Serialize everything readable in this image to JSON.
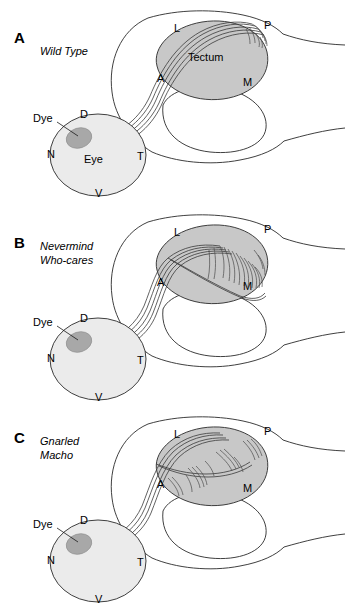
{
  "figure": {
    "background_color": "#ffffff",
    "panel_count": 3,
    "description_labels": {
      "eye": "Eye",
      "tectum": "Tectum",
      "dye": "Dye"
    },
    "eye_axes": {
      "dorsal": "D",
      "nasal": "N",
      "temporal": "T",
      "ventral": "V"
    },
    "tectum_axes": {
      "lateral": "L",
      "posterior": "P",
      "anterior": "A",
      "medial": "M"
    },
    "colors": {
      "tectum_fill": "#c8c8c8",
      "eye_fill": "#ebebeb",
      "dye_fill": "#a8a8a8",
      "outline_stroke": "#2a2a2a",
      "axon_stroke": "#3a3a3a",
      "background": "#ffffff"
    }
  },
  "panels": [
    {
      "letter": "A",
      "genotype_line1": "Wild Type",
      "genotype_line2": "",
      "show_tectum_text": true,
      "show_eye_text": true,
      "dye_label": "Dye",
      "eye_label": "Eye",
      "tectum_label": "Tectum",
      "axis_D": "D",
      "axis_N": "N",
      "axis_T": "T",
      "axis_V": "V",
      "axis_L": "L",
      "axis_P": "P",
      "axis_A": "A",
      "axis_M": "M",
      "phenotype": "axons converge to a single tight terminal arbor at the posterior tectum"
    },
    {
      "letter": "B",
      "genotype_line1": "Nevermind",
      "genotype_line2": "Who-cares",
      "show_tectum_text": false,
      "show_eye_text": false,
      "dye_label": "Dye",
      "eye_label": "",
      "tectum_label": "",
      "axis_D": "D",
      "axis_N": "N",
      "axis_T": "T",
      "axis_V": "V",
      "axis_L": "L",
      "axis_P": "P",
      "axis_A": "A",
      "axis_M": "M",
      "phenotype": "axons enter at anterior pole and spread broadly with many branches across posterior tectum"
    },
    {
      "letter": "C",
      "genotype_line1": "Gnarled",
      "genotype_line2": "Macho",
      "show_tectum_text": false,
      "show_eye_text": false,
      "dye_label": "Dye",
      "eye_label": "",
      "tectum_label": "",
      "axis_D": "D",
      "axis_N": "N",
      "axis_T": "T",
      "axis_V": "V",
      "axis_L": "L",
      "axis_P": "P",
      "axis_A": "A",
      "axis_M": "M",
      "phenotype": "scattered ectopic arbors distributed within the tectum"
    }
  ]
}
